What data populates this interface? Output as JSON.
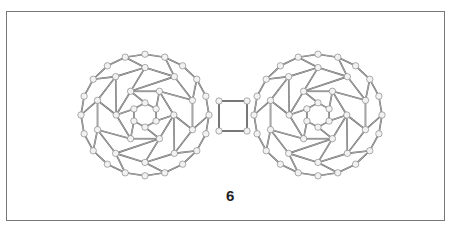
{
  "figure": {
    "compound_label": "6",
    "colors": {
      "bond": "#555555",
      "atom_fill": "#f2f2f2",
      "atom_stroke": "#777777",
      "frame": "#777777"
    },
    "left_cage": {
      "cx": 145,
      "cy": 115,
      "r": 64
    },
    "right_cage": {
      "cx": 318,
      "cy": 115,
      "r": 64
    },
    "bridge": {
      "x1": 219,
      "y1": 101,
      "x2": 247,
      "y2": 131
    }
  }
}
